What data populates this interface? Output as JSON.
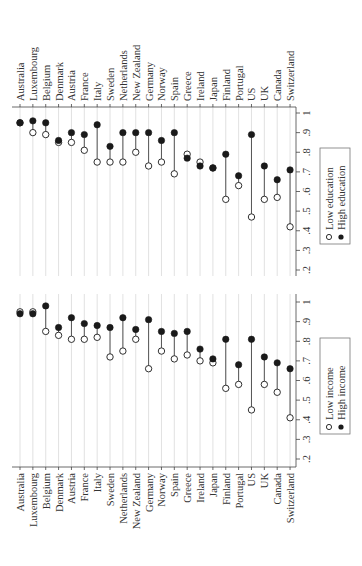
{
  "chart_data": [
    {
      "type": "dot-plot",
      "title": "",
      "orientation": "rotated-90",
      "xlabel": "",
      "ylabel": "",
      "ylim": [
        0.2,
        1.0
      ],
      "ticks": [
        ".2",
        ".3",
        ".4",
        ".5",
        ".6",
        ".7",
        ".8",
        ".9",
        "1"
      ],
      "grid": true,
      "legend_position": "right-bottom",
      "categories": [
        "Australia",
        "Luxembourg",
        "Belgium",
        "Denmark",
        "Austria",
        "France",
        "Italy",
        "Sweden",
        "Netherlands",
        "New Zealand",
        "Germany",
        "Norway",
        "Spain",
        "Greece",
        "Ireland",
        "Japan",
        "Finland",
        "Portugal",
        "US",
        "UK",
        "Canada",
        "Switzerland"
      ],
      "series": [
        {
          "name": "Low education",
          "marker": "hollow-circle",
          "values": [
            0.95,
            0.9,
            0.89,
            0.85,
            0.85,
            0.81,
            0.75,
            0.75,
            0.75,
            0.8,
            0.73,
            0.75,
            0.69,
            0.79,
            0.75,
            0.72,
            0.56,
            0.63,
            0.47,
            0.56,
            0.57,
            0.42
          ]
        },
        {
          "name": "High education",
          "marker": "filled-circle",
          "values": [
            0.95,
            0.96,
            0.95,
            0.86,
            0.9,
            0.89,
            0.94,
            0.83,
            0.9,
            0.9,
            0.9,
            0.86,
            0.9,
            0.77,
            0.73,
            0.72,
            0.79,
            0.68,
            0.89,
            0.73,
            0.66,
            0.71
          ]
        }
      ]
    },
    {
      "type": "dot-plot",
      "title": "",
      "orientation": "rotated-90",
      "xlabel": "",
      "ylabel": "",
      "ylim": [
        0.2,
        1.0
      ],
      "ticks": [
        ".2",
        ".3",
        ".4",
        ".5",
        ".6",
        ".7",
        ".8",
        ".9",
        "1"
      ],
      "grid": true,
      "legend_position": "right-bottom",
      "categories": [
        "Australia",
        "Luxembourg",
        "Belgium",
        "Denmark",
        "Austria",
        "France",
        "Italy",
        "Sweden",
        "Netherlands",
        "New Zealand",
        "Germany",
        "Norway",
        "Spain",
        "Greece",
        "Ireland",
        "Japan",
        "Finland",
        "Portugal",
        "US",
        "UK",
        "Canada",
        "Switzerland"
      ],
      "series": [
        {
          "name": "Low income",
          "marker": "hollow-circle",
          "values": [
            0.95,
            0.95,
            0.85,
            0.83,
            0.81,
            0.81,
            0.82,
            0.72,
            0.75,
            0.81,
            0.66,
            0.75,
            0.71,
            0.73,
            0.7,
            0.69,
            0.56,
            0.58,
            0.45,
            0.58,
            0.54,
            0.41
          ]
        },
        {
          "name": "High income",
          "marker": "filled-circle",
          "values": [
            0.94,
            0.94,
            0.98,
            0.87,
            0.92,
            0.89,
            0.88,
            0.87,
            0.92,
            0.86,
            0.91,
            0.85,
            0.84,
            0.85,
            0.76,
            0.71,
            0.81,
            0.68,
            0.81,
            0.72,
            0.69,
            0.66
          ]
        }
      ]
    }
  ],
  "colors": {
    "marker": "#1a1a1a",
    "stem": "#555555",
    "grid": "#d9d9d9",
    "axis": "#444444",
    "background": "#ffffff"
  }
}
